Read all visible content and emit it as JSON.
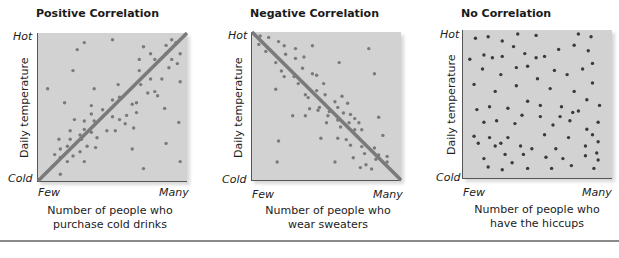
{
  "chart_data": [
    {
      "type": "scatter",
      "title": "Positive Correlation",
      "xlabel": "Number of people who purchase cold drinks",
      "xlabel_lines": [
        "Number of people who",
        "purchase cold drinks"
      ],
      "ylabel": "Daily temperature",
      "x_tick_labels": [
        "Few",
        "Many"
      ],
      "y_tick_labels": [
        "Cold",
        "Hot"
      ],
      "trend_line": {
        "from": [
          0,
          0
        ],
        "to": [
          1,
          1
        ]
      },
      "dot_color": "#7a7a7a",
      "line_color": "#7a7a7a",
      "points": [
        [
          0.3,
          0.96
        ],
        [
          0.92,
          0.98
        ],
        [
          0.5,
          0.98
        ],
        [
          0.95,
          0.96
        ],
        [
          0.88,
          0.94
        ],
        [
          0.72,
          0.93
        ],
        [
          0.25,
          0.91
        ],
        [
          0.77,
          0.88
        ],
        [
          0.88,
          0.88
        ],
        [
          0.98,
          0.88
        ],
        [
          0.69,
          0.84
        ],
        [
          0.92,
          0.84
        ],
        [
          0.8,
          0.84
        ],
        [
          0.96,
          0.81
        ],
        [
          0.9,
          0.78
        ],
        [
          0.22,
          0.76
        ],
        [
          0.69,
          0.76
        ],
        [
          0.85,
          0.7
        ],
        [
          0.77,
          0.7
        ],
        [
          0.98,
          0.68
        ],
        [
          0.7,
          0.66
        ],
        [
          0.54,
          0.66
        ],
        [
          0.04,
          0.63
        ],
        [
          0.37,
          0.63
        ],
        [
          0.8,
          0.61
        ],
        [
          0.75,
          0.6
        ],
        [
          0.82,
          0.58
        ],
        [
          0.55,
          0.57
        ],
        [
          0.16,
          0.53
        ],
        [
          0.5,
          0.55
        ],
        [
          0.64,
          0.52
        ],
        [
          0.35,
          0.51
        ],
        [
          0.67,
          0.53
        ],
        [
          0.87,
          0.49
        ],
        [
          0.43,
          0.48
        ],
        [
          0.67,
          0.46
        ],
        [
          0.6,
          0.44
        ],
        [
          0.35,
          0.45
        ],
        [
          0.5,
          0.43
        ],
        [
          0.55,
          0.41
        ],
        [
          0.23,
          0.41
        ],
        [
          0.3,
          0.4
        ],
        [
          0.37,
          0.4
        ],
        [
          0.59,
          0.38
        ],
        [
          0.97,
          0.39
        ],
        [
          0.65,
          0.35
        ],
        [
          0.3,
          0.34
        ],
        [
          0.2,
          0.33
        ],
        [
          0.35,
          0.32
        ],
        [
          0.46,
          0.33
        ],
        [
          0.52,
          0.33
        ],
        [
          0.27,
          0.3
        ],
        [
          0.39,
          0.28
        ],
        [
          0.12,
          0.27
        ],
        [
          0.2,
          0.27
        ],
        [
          0.28,
          0.27
        ],
        [
          0.88,
          0.24
        ],
        [
          0.18,
          0.22
        ],
        [
          0.32,
          0.22
        ],
        [
          0.38,
          0.21
        ],
        [
          0.13,
          0.2
        ],
        [
          0.64,
          0.2
        ],
        [
          0.27,
          0.18
        ],
        [
          0.09,
          0.16
        ],
        [
          0.13,
          0.14
        ],
        [
          0.22,
          0.15
        ],
        [
          0.18,
          0.11
        ],
        [
          0.3,
          0.11
        ],
        [
          0.98,
          0.11
        ],
        [
          0.72,
          0.06
        ],
        [
          0.08,
          0.08
        ],
        [
          0.13,
          0.02
        ]
      ]
    },
    {
      "type": "scatter",
      "title": "Negative Correlation",
      "xlabel": "Number of people who wear sweaters",
      "xlabel_lines": [
        "Number of people who",
        "wear sweaters"
      ],
      "ylabel": "Daily temperature",
      "x_tick_labels": [
        "Few",
        "Many"
      ],
      "y_tick_labels": [
        "Cold",
        "Hot"
      ],
      "trend_line": {
        "from": [
          0,
          1
        ],
        "to": [
          1,
          0
        ]
      },
      "dot_color": "#7a7a7a",
      "line_color": "#7a7a7a",
      "points": [
        [
          0.03,
          1.0
        ],
        [
          0.09,
          0.99
        ],
        [
          0.16,
          0.96
        ],
        [
          0.02,
          0.94
        ],
        [
          0.2,
          0.93
        ],
        [
          0.4,
          0.93
        ],
        [
          0.28,
          0.91
        ],
        [
          0.8,
          0.91
        ],
        [
          0.07,
          0.89
        ],
        [
          0.21,
          0.87
        ],
        [
          0.28,
          0.84
        ],
        [
          0.34,
          0.85
        ],
        [
          0.14,
          0.81
        ],
        [
          0.59,
          0.81
        ],
        [
          0.33,
          0.77
        ],
        [
          0.18,
          0.75
        ],
        [
          0.4,
          0.73
        ],
        [
          0.84,
          0.73
        ],
        [
          0.2,
          0.71
        ],
        [
          0.27,
          0.71
        ],
        [
          0.43,
          0.72
        ],
        [
          0.3,
          0.66
        ],
        [
          0.48,
          0.66
        ],
        [
          0.14,
          0.62
        ],
        [
          0.43,
          0.61
        ],
        [
          0.35,
          0.58
        ],
        [
          0.49,
          0.58
        ],
        [
          0.37,
          0.56
        ],
        [
          0.61,
          0.57
        ],
        [
          0.56,
          0.53
        ],
        [
          0.65,
          0.52
        ],
        [
          0.45,
          0.49
        ],
        [
          0.58,
          0.49
        ],
        [
          0.38,
          0.48
        ],
        [
          0.52,
          0.46
        ],
        [
          0.62,
          0.45
        ],
        [
          0.44,
          0.47
        ],
        [
          0.67,
          0.44
        ],
        [
          0.26,
          0.43
        ],
        [
          0.51,
          0.43
        ],
        [
          0.58,
          0.4
        ],
        [
          0.7,
          0.41
        ],
        [
          0.87,
          0.42
        ],
        [
          0.5,
          0.38
        ],
        [
          0.66,
          0.38
        ],
        [
          0.73,
          0.38
        ],
        [
          0.9,
          0.29
        ],
        [
          0.6,
          0.35
        ],
        [
          0.7,
          0.33
        ],
        [
          0.46,
          0.27
        ],
        [
          0.58,
          0.27
        ],
        [
          0.64,
          0.26
        ],
        [
          0.67,
          0.22
        ],
        [
          0.75,
          0.21
        ],
        [
          0.84,
          0.2
        ],
        [
          0.77,
          0.16
        ],
        [
          0.69,
          0.13
        ],
        [
          0.87,
          0.15
        ],
        [
          0.85,
          0.12
        ],
        [
          0.93,
          0.14
        ],
        [
          0.15,
          0.1
        ],
        [
          0.56,
          0.1
        ],
        [
          0.78,
          0.08
        ],
        [
          0.93,
          0.1
        ],
        [
          0.74,
          0.06
        ],
        [
          0.82,
          0.05
        ],
        [
          0.35,
          0.43
        ],
        [
          0.16,
          0.25
        ],
        [
          0.75,
          0.33
        ]
      ]
    },
    {
      "type": "scatter",
      "title": "No Correlation",
      "xlabel": "Number of people who have the hiccups",
      "xlabel_lines": [
        "Number of people who",
        "have the hiccups"
      ],
      "ylabel": "Daily temperature",
      "x_tick_labels": [
        "Few",
        "Many"
      ],
      "y_tick_labels": [
        "Cold",
        "Hot"
      ],
      "trend_line": null,
      "dot_color": "#3a3a3a",
      "points": [
        [
          0.06,
          0.97
        ],
        [
          0.15,
          0.98
        ],
        [
          0.25,
          0.95
        ],
        [
          0.36,
          1.0
        ],
        [
          0.49,
          0.99
        ],
        [
          0.79,
          1.0
        ],
        [
          0.88,
          0.98
        ],
        [
          0.33,
          0.91
        ],
        [
          0.76,
          0.92
        ],
        [
          0.65,
          0.89
        ],
        [
          0.12,
          0.85
        ],
        [
          0.18,
          0.83
        ],
        [
          0.25,
          0.84
        ],
        [
          0.41,
          0.86
        ],
        [
          0.49,
          0.83
        ],
        [
          0.55,
          0.84
        ],
        [
          0.86,
          0.88
        ],
        [
          0.02,
          0.82
        ],
        [
          0.89,
          0.79
        ],
        [
          0.11,
          0.75
        ],
        [
          0.24,
          0.71
        ],
        [
          0.35,
          0.76
        ],
        [
          0.43,
          0.77
        ],
        [
          0.62,
          0.74
        ],
        [
          0.82,
          0.75
        ],
        [
          0.71,
          0.71
        ],
        [
          0.05,
          0.64
        ],
        [
          0.2,
          0.59
        ],
        [
          0.35,
          0.63
        ],
        [
          0.5,
          0.68
        ],
        [
          0.59,
          0.61
        ],
        [
          0.89,
          0.65
        ],
        [
          0.76,
          0.59
        ],
        [
          0.43,
          0.52
        ],
        [
          0.52,
          0.49
        ],
        [
          0.16,
          0.48
        ],
        [
          0.07,
          0.46
        ],
        [
          0.29,
          0.47
        ],
        [
          0.67,
          0.48
        ],
        [
          0.85,
          0.53
        ],
        [
          0.94,
          0.49
        ],
        [
          0.79,
          0.45
        ],
        [
          0.39,
          0.42
        ],
        [
          0.52,
          0.41
        ],
        [
          0.66,
          0.41
        ],
        [
          0.73,
          0.38
        ],
        [
          0.75,
          0.44
        ],
        [
          0.12,
          0.37
        ],
        [
          0.21,
          0.38
        ],
        [
          0.34,
          0.36
        ],
        [
          0.61,
          0.35
        ],
        [
          0.85,
          0.32
        ],
        [
          0.93,
          0.37
        ],
        [
          0.05,
          0.27
        ],
        [
          0.16,
          0.26
        ],
        [
          0.29,
          0.26
        ],
        [
          0.55,
          0.28
        ],
        [
          0.72,
          0.26
        ],
        [
          0.89,
          0.28
        ],
        [
          0.93,
          0.23
        ],
        [
          0.08,
          0.22
        ],
        [
          0.2,
          0.2
        ],
        [
          0.24,
          0.22
        ],
        [
          0.38,
          0.2
        ],
        [
          0.46,
          0.18
        ],
        [
          0.63,
          0.18
        ],
        [
          0.84,
          0.2
        ],
        [
          0.92,
          0.15
        ],
        [
          0.12,
          0.11
        ],
        [
          0.27,
          0.14
        ],
        [
          0.4,
          0.14
        ],
        [
          0.56,
          0.12
        ],
        [
          0.68,
          0.11
        ],
        [
          0.84,
          0.13
        ],
        [
          0.93,
          0.1
        ],
        [
          0.15,
          0.05
        ],
        [
          0.32,
          0.08
        ],
        [
          0.43,
          0.04
        ],
        [
          0.6,
          0.04
        ],
        [
          0.74,
          0.06
        ],
        [
          0.9,
          0.04
        ],
        [
          0.25,
          0.03
        ]
      ]
    }
  ]
}
